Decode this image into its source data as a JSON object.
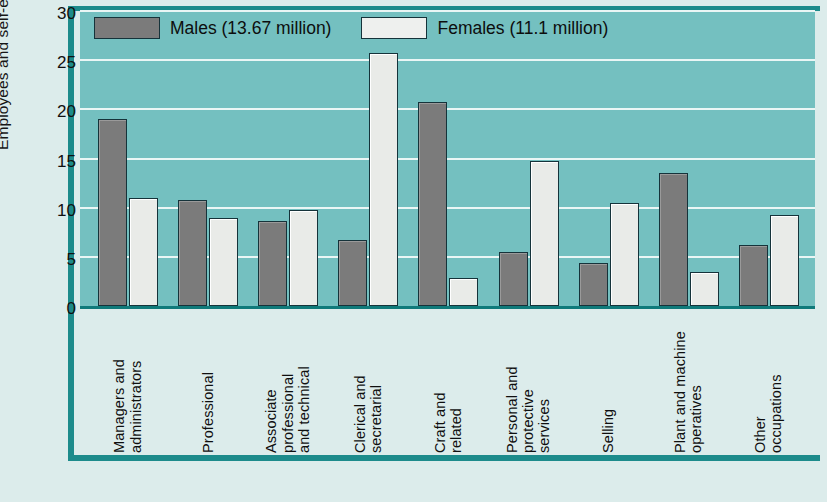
{
  "chart_data": {
    "type": "bar",
    "title": "",
    "xlabel": "",
    "ylabel": "Employees and self-employed (%)",
    "ylim": [
      0,
      30
    ],
    "yticks": [
      0,
      5,
      10,
      15,
      20,
      25,
      30
    ],
    "grid": true,
    "legend_position": "top-left-inside",
    "categories": [
      [
        "Managers and",
        "administrators"
      ],
      [
        "Professional"
      ],
      [
        "Associate",
        "professional",
        "and technical"
      ],
      [
        "Clerical and",
        "secretarial"
      ],
      [
        "Craft and",
        "related"
      ],
      [
        "Personal and",
        "protective",
        "services"
      ],
      [
        "Selling"
      ],
      [
        "Plant and machine",
        "operatives"
      ],
      [
        "Other",
        "occupations"
      ]
    ],
    "series": [
      {
        "name": "Males (13.67 million)",
        "color": "#7b7b7b",
        "values": [
          19.0,
          10.8,
          8.6,
          6.7,
          20.7,
          5.5,
          4.4,
          13.5,
          6.2
        ]
      },
      {
        "name": "Females (11.1 million)",
        "color": "#e9ebe8",
        "values": [
          11.0,
          8.9,
          9.8,
          25.7,
          2.8,
          14.7,
          10.5,
          3.5,
          9.3
        ]
      }
    ]
  },
  "colors": {
    "plot_background": "#74c0c0",
    "page_background": "#dceceb",
    "frame": "#1c8b8b",
    "gridline": "#eaf6f5",
    "baseline": "#0f7a7a",
    "male_bar": "#7b7b7b",
    "female_bar": "#e9ebe8"
  }
}
